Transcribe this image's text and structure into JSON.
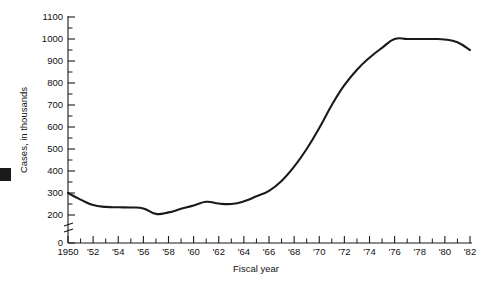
{
  "chart_data": {
    "type": "line",
    "title": "",
    "xlabel": "Fiscal year",
    "ylabel": "Cases, in thousands",
    "xlim": [
      1950,
      1982
    ],
    "ylim": [
      0,
      1100
    ],
    "y_axis_break": true,
    "y_axis_break_between": [
      0,
      200
    ],
    "grid": false,
    "legend": null,
    "y_tick_labels": [
      "1100",
      "1000",
      "900",
      "800",
      "700",
      "600",
      "500",
      "400",
      "300",
      "200",
      "0"
    ],
    "y_tick_values": [
      1100,
      1000,
      900,
      800,
      700,
      600,
      500,
      400,
      300,
      200,
      0
    ],
    "y_minor_step": 50,
    "x_tick_labels": [
      "1950",
      "'52",
      "'54",
      "'56",
      "'58",
      "'60",
      "'62",
      "'64",
      "'66",
      "'68",
      "'70",
      "'72",
      "'74",
      "'76",
      "'78",
      "'80",
      "'82"
    ],
    "x_tick_values": [
      1950,
      1952,
      1954,
      1956,
      1958,
      1960,
      1962,
      1964,
      1966,
      1968,
      1970,
      1972,
      1974,
      1976,
      1978,
      1980,
      1982
    ],
    "x_minor_step": 1,
    "series": [
      {
        "name": "Cases",
        "color": "#1a1a1a",
        "x": [
          1950,
          1951,
          1952,
          1953,
          1954,
          1955,
          1956,
          1957,
          1958,
          1959,
          1960,
          1961,
          1962,
          1963,
          1964,
          1965,
          1966,
          1967,
          1968,
          1969,
          1970,
          1971,
          1972,
          1973,
          1974,
          1975,
          1976,
          1977,
          1978,
          1979,
          1980,
          1981,
          1982
        ],
        "values": [
          300,
          270,
          245,
          237,
          235,
          234,
          230,
          205,
          212,
          228,
          243,
          260,
          252,
          250,
          262,
          285,
          310,
          355,
          420,
          500,
          595,
          700,
          790,
          860,
          915,
          960,
          1000,
          1000,
          1000,
          1000,
          998,
          985,
          950
        ]
      }
    ]
  },
  "axis": {
    "x_title": "Fiscal year",
    "y_title": "Cases, in thousands"
  }
}
